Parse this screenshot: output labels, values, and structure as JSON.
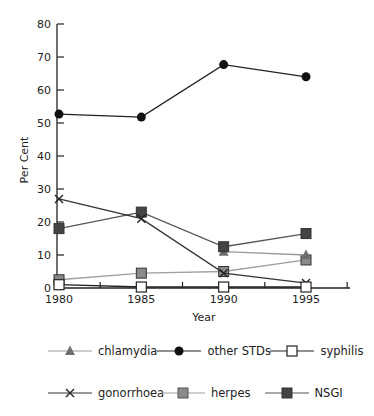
{
  "chart_data": {
    "type": "line",
    "title": "",
    "xlabel": "Year",
    "ylabel": "Per Cent",
    "x": [
      1980,
      1985,
      1990,
      1995
    ],
    "x_tick_labels": [
      "1980",
      "1985",
      "1990",
      "1995"
    ],
    "y_tick_labels": [
      "0",
      "10",
      "20",
      "30",
      "40",
      "50",
      "60",
      "70",
      "80"
    ],
    "ylim": [
      0,
      80
    ],
    "grid": false,
    "legend_position": "bottom",
    "series": [
      {
        "name": "chlamydia",
        "marker": "triangle",
        "color": "#6e6e6e",
        "line_color": "#9a9a9a",
        "values": [
          null,
          null,
          11,
          10
        ]
      },
      {
        "name": "other STDs",
        "marker": "circle",
        "color": "#111111",
        "line_color": "#222222",
        "values": [
          52.7,
          51.8,
          67.7,
          64
        ]
      },
      {
        "name": "syphilis",
        "marker": "open-square",
        "color": "#ffffff",
        "line_color": "#222222",
        "values": [
          1,
          0.3,
          0.3,
          0.3
        ]
      },
      {
        "name": "gonorrhoea",
        "marker": "x",
        "color": "#222222",
        "line_color": "#333333",
        "values": [
          27,
          21,
          4.5,
          1.5
        ]
      },
      {
        "name": "herpes",
        "marker": "square",
        "color": "#8a8a8a",
        "line_color": "#a0a0a0",
        "values": [
          2.5,
          4.5,
          5,
          8.5
        ]
      },
      {
        "name": "NSGI",
        "marker": "square",
        "color": "#444444",
        "line_color": "#555555",
        "values": [
          18,
          23,
          12.5,
          16.5
        ]
      }
    ]
  },
  "legend": {
    "rows": [
      [
        "chlamydia",
        "other STDs",
        "syphilis"
      ],
      [
        "gonorrhoea",
        "herpes",
        "NSGI"
      ]
    ]
  }
}
